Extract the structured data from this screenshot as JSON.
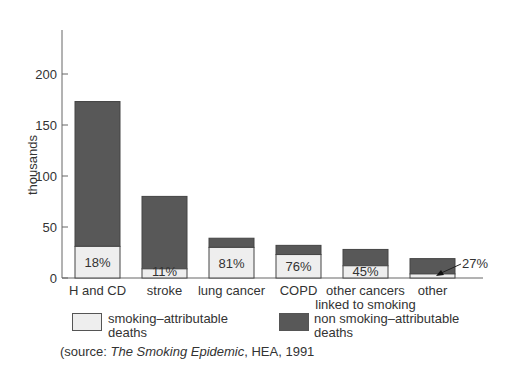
{
  "chart_data": {
    "type": "bar",
    "stacked": true,
    "title": "",
    "xlabel": "",
    "ylabel": "thousands",
    "ylim": [
      0,
      230
    ],
    "yticks": [
      0,
      50,
      100,
      150,
      200
    ],
    "grid": false,
    "legend_position": "bottom",
    "categories": [
      "H and CD",
      "stroke",
      "lung cancer",
      "COPD",
      "other cancers linked to smoking",
      "other"
    ],
    "category_lines": [
      [
        "H and CD"
      ],
      [
        "stroke"
      ],
      [
        "lung cancer"
      ],
      [
        "COPD"
      ],
      [
        "other cancers",
        "linked to smoking"
      ],
      [
        "other"
      ]
    ],
    "series": [
      {
        "name": "smoking–attributable deaths",
        "color": "#eeeeee",
        "values": [
          31,
          9,
          30,
          23,
          12,
          4
        ]
      },
      {
        "name": "non smoking–attributable deaths",
        "color": "#585858",
        "values": [
          142,
          71,
          9,
          9,
          16,
          15
        ]
      }
    ],
    "totals": [
      173,
      80,
      39,
      32,
      28,
      19
    ],
    "annotations": [
      "18%",
      "11%",
      "81%",
      "76%",
      "45%",
      "27%"
    ]
  },
  "legend": {
    "light_label_line1": "smoking–attributable",
    "light_label_line2": "deaths",
    "dark_label_line1": "non smoking–attributable",
    "dark_label_line2": "deaths"
  },
  "source": {
    "prefix": "(source: ",
    "title": "The Smoking Epidemic",
    "suffix": ", HEA, 1991"
  }
}
